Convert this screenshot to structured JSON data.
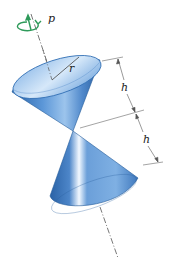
{
  "figure": {
    "labels": {
      "rotation": "p",
      "radius": "r",
      "height_upper": "h",
      "height_lower": "h"
    },
    "colors": {
      "cone_dark": "#2f6db3",
      "cone_mid": "#5b95d6",
      "cone_light": "#cfe3f7",
      "cone_top_face": "#7fb0e4",
      "rotation_arrow": "#2e9a5a",
      "lines": "#555555"
    }
  }
}
